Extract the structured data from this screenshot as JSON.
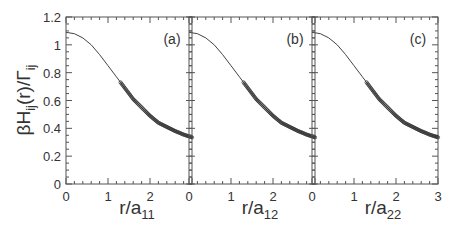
{
  "chart_data": {
    "type": "line",
    "ylabel": "βH_ij(r)/Γ_ij",
    "ylabel_parts": {
      "main": "βH",
      "sub1": "ij",
      "mid": "(r)/Γ",
      "sub2": "ij"
    },
    "ylim": [
      0,
      1.2
    ],
    "yticks": [
      "0",
      "0.2",
      "0.4",
      "0.6",
      "0.8",
      "1",
      "1.2"
    ],
    "ytick_values": [
      0,
      0.2,
      0.4,
      0.6,
      0.8,
      1.0,
      1.2
    ],
    "xlim": [
      0,
      3
    ],
    "xtick_values": [
      0,
      1,
      2,
      3
    ],
    "grid": false,
    "panels": [
      {
        "label": "(a)",
        "xlabel": "r/a",
        "xlabel_sub": "11",
        "xticks": [
          "0",
          "1",
          "2",
          ""
        ]
      },
      {
        "label": "(b)",
        "xlabel": "r/a",
        "xlabel_sub": "12",
        "xticks": [
          "0",
          "1",
          "2",
          ""
        ]
      },
      {
        "label": "(c)",
        "xlabel": "r/a",
        "xlabel_sub": "22",
        "xticks": [
          "0",
          "1",
          "2",
          "3"
        ]
      }
    ],
    "series": [
      {
        "name": "theory (solid line)",
        "style": "line",
        "x": [
          0,
          0.2,
          0.4,
          0.6,
          0.8,
          1.0,
          1.2,
          1.4,
          1.6,
          1.8,
          2.0,
          2.2,
          2.4,
          2.6,
          2.8,
          3.0
        ],
        "y": [
          1.09,
          1.08,
          1.05,
          1.0,
          0.93,
          0.85,
          0.77,
          0.69,
          0.61,
          0.55,
          0.49,
          0.44,
          0.41,
          0.38,
          0.355,
          0.335
        ]
      },
      {
        "name": "simulation (open circles)",
        "style": "markers",
        "x_range": [
          1.3,
          3.0
        ],
        "x": [
          1.3,
          1.4,
          1.5,
          1.6,
          1.7,
          1.8,
          1.9,
          2.0,
          2.1,
          2.2,
          2.3,
          2.4,
          2.5,
          2.6,
          2.7,
          2.8,
          2.9,
          3.0
        ],
        "y": [
          0.73,
          0.69,
          0.65,
          0.61,
          0.58,
          0.55,
          0.52,
          0.49,
          0.465,
          0.44,
          0.425,
          0.41,
          0.395,
          0.38,
          0.368,
          0.355,
          0.345,
          0.335
        ]
      }
    ]
  }
}
